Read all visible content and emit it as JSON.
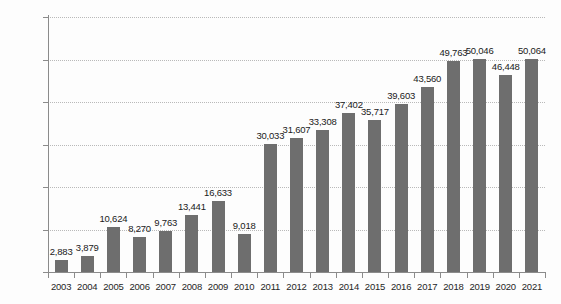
{
  "chart_data": {
    "type": "bar",
    "title": "",
    "subtitle": "",
    "xlabel": "",
    "ylabel": "",
    "categories": [
      "2003",
      "2004",
      "2005",
      "2006",
      "2007",
      "2008",
      "2009",
      "2010",
      "2011",
      "2012",
      "2013",
      "2014",
      "2015",
      "2016",
      "2017",
      "2018",
      "2019",
      "2020",
      "2021"
    ],
    "values": [
      2883,
      3879,
      10624,
      8270,
      9763,
      13441,
      16633,
      9018,
      30033,
      31607,
      33308,
      37402,
      35717,
      39603,
      43560,
      49763,
      50046,
      46448,
      50064
    ],
    "value_labels": [
      "2,883",
      "3,879",
      "10,624",
      "8,270",
      "9,763",
      "13,441",
      "16,633",
      "9,018",
      "30,033",
      "31,607",
      "33,308",
      "37,402",
      "35,717",
      "39,603",
      "43,560",
      "49,763",
      "50,046",
      "46,448",
      "50,064"
    ],
    "ylim": [
      0,
      60000
    ],
    "yticks": [
      0,
      10000,
      20000,
      30000,
      40000,
      50000,
      60000
    ],
    "ytick_labels": [
      "0",
      "10,000",
      "20,000",
      "30,000",
      "40,000",
      "50,000",
      "60,000"
    ],
    "grid": true,
    "legend": "none",
    "series_color": "#6e6e6e",
    "gridline_color": "#b9b9b9",
    "axis_color": "#8b8b8b"
  }
}
